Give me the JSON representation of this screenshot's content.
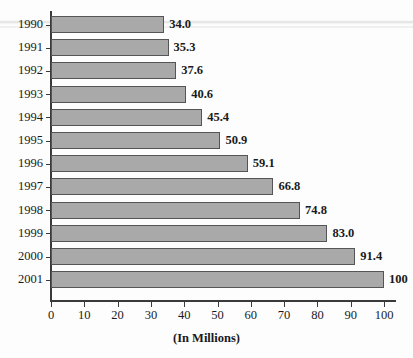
{
  "chart_data": {
    "type": "bar",
    "orientation": "horizontal",
    "title": "",
    "subtitle": "",
    "xlabel": "(In Millions)",
    "ylabel": "",
    "categories": [
      "1990",
      "1991",
      "1992",
      "1993",
      "1994",
      "1995",
      "1996",
      "1997",
      "1998",
      "1999",
      "2000",
      "2001"
    ],
    "values": [
      34.0,
      35.3,
      37.6,
      40.6,
      45.4,
      50.9,
      59.1,
      66.8,
      74.8,
      83.0,
      91.4,
      100
    ],
    "data_labels": [
      "34.0",
      "35.3",
      "37.6",
      "40.6",
      "45.4",
      "50.9",
      "59.1",
      "66.8",
      "74.8",
      "83.0",
      "91.4",
      "100"
    ],
    "xlim": [
      0,
      100
    ],
    "x_ticks": [
      0,
      10,
      20,
      30,
      40,
      50,
      60,
      70,
      80,
      90,
      100
    ],
    "x_tick_labels": [
      "0",
      "10",
      "20",
      "30",
      "40",
      "50",
      "60",
      "70",
      "80",
      "90",
      "100"
    ],
    "grid": false,
    "legend": false,
    "legend_position": "none",
    "bar_color": "#a9a9a9",
    "bar_edge_color": "#555555",
    "axis_color": "#3a3a3a",
    "text_color": "#1a1a1a",
    "background_color": "#fdfdfd"
  }
}
